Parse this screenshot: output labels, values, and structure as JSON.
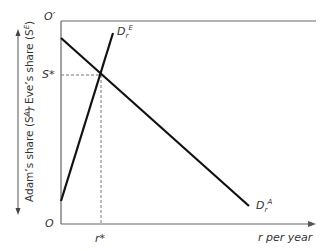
{
  "diagram": {
    "origin_bottom_label": "O",
    "origin_top_label": "O′",
    "x_axis_label": "r per year",
    "equilibrium_share_label": "S*",
    "equilibrium_rate_label": "r*",
    "vertical_axis": {
      "top_label": "Eve’s share (S",
      "top_label_sup": "E",
      "top_label_close": ")",
      "bottom_label": "Adam’s share (S",
      "bottom_label_sup": "A",
      "bottom_label_close": ")"
    },
    "curves": [
      {
        "name": "D",
        "sub": "r",
        "sup": "E",
        "description": "Eve's demand, upward sloping from O"
      },
      {
        "name": "D",
        "sub": "r",
        "sup": "A",
        "description": "Adam's demand, downward sloping from O′"
      }
    ],
    "colors": {
      "curve": "#111111",
      "axis": "#555555",
      "dashed": "#777777",
      "text": "#333333"
    }
  }
}
